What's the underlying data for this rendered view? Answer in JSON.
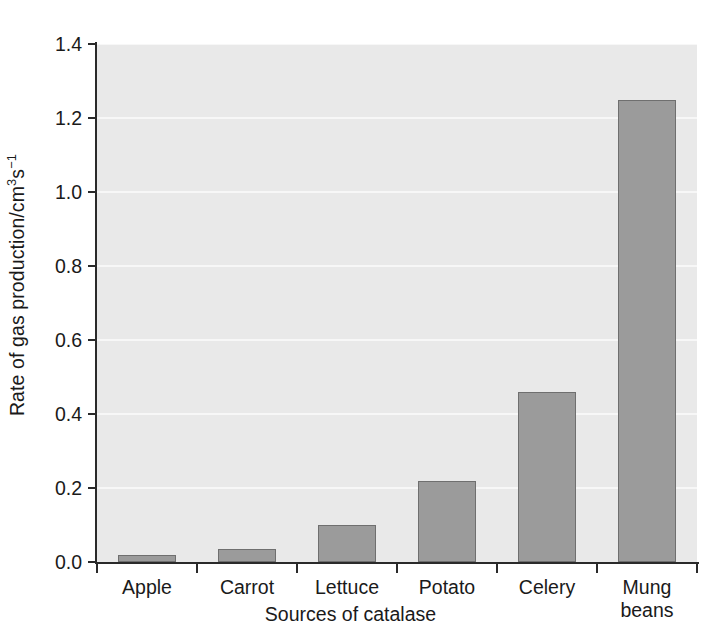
{
  "chart_data": {
    "type": "bar",
    "title": "",
    "xlabel": "Sources of catalase",
    "ylabel": "Rate of gas production/cm3s-1",
    "ylabel_parts": {
      "prefix": "Rate of gas production/cm",
      "sup1": "3",
      "mid": "s",
      "sup2": "−1"
    },
    "categories": [
      "Apple",
      "Carrot",
      "Lettuce",
      "Potato",
      "Celery",
      "Mung\nbeans"
    ],
    "values": [
      0.02,
      0.035,
      0.1,
      0.22,
      0.46,
      1.25
    ],
    "ylim": [
      0.0,
      1.4
    ],
    "xlim_categories": 6,
    "yticks": [
      0.0,
      0.2,
      0.4,
      0.6,
      0.8,
      1.0,
      1.2,
      1.4
    ],
    "ytick_labels": [
      "0.0",
      "0.2",
      "0.4",
      "0.6",
      "0.8",
      "1.0",
      "1.2",
      "1.4"
    ],
    "grid": true,
    "grid_color": "#f7f7f7",
    "legend": null,
    "bar_color": "#9b9b9b",
    "bar_edge_color": "#6f6f6f",
    "plot_background": "#e9e9e9",
    "figure_background": "#ffffff",
    "axis_color": "#2a2a2a",
    "text_color": "#1a1a1a"
  }
}
